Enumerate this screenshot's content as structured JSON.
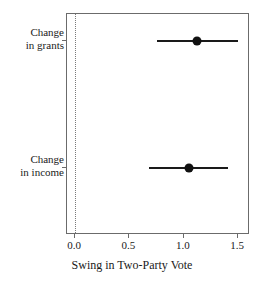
{
  "chart_data": {
    "type": "scatter",
    "title": "",
    "xlabel": "Swing in Two-Party Vote",
    "ylabel": "",
    "xlim": [
      -0.075,
      1.61
    ],
    "ylim": [
      0,
      2
    ],
    "grid": false,
    "legend": null,
    "xticks": [
      {
        "value": 0.0,
        "label": "0.0"
      },
      {
        "value": 0.5,
        "label": "0.5"
      },
      {
        "value": 1.0,
        "label": "1.0"
      },
      {
        "value": 1.5,
        "label": "1.5"
      }
    ],
    "reference_line": {
      "value": 0.0,
      "style": "dotted"
    },
    "categories": [
      "Change in grants",
      "Change in income"
    ],
    "series": [
      {
        "name": "Coefficient estimate with confidence interval",
        "points": [
          {
            "category": "Change in grants",
            "label_line1": "Change",
            "label_line2": "in grants",
            "estimate": 1.12,
            "ci_low": 0.75,
            "ci_high": 1.5
          },
          {
            "category": "Change in income",
            "label_line1": "Change",
            "label_line2": "in income",
            "estimate": 1.05,
            "ci_low": 0.68,
            "ci_high": 1.41
          }
        ]
      }
    ]
  },
  "colors": {
    "point": "#111111",
    "interval": "#1a1a1a",
    "axis": "#6b6b6b",
    "reference": "#7a7a7a",
    "background": "#ffffff"
  }
}
